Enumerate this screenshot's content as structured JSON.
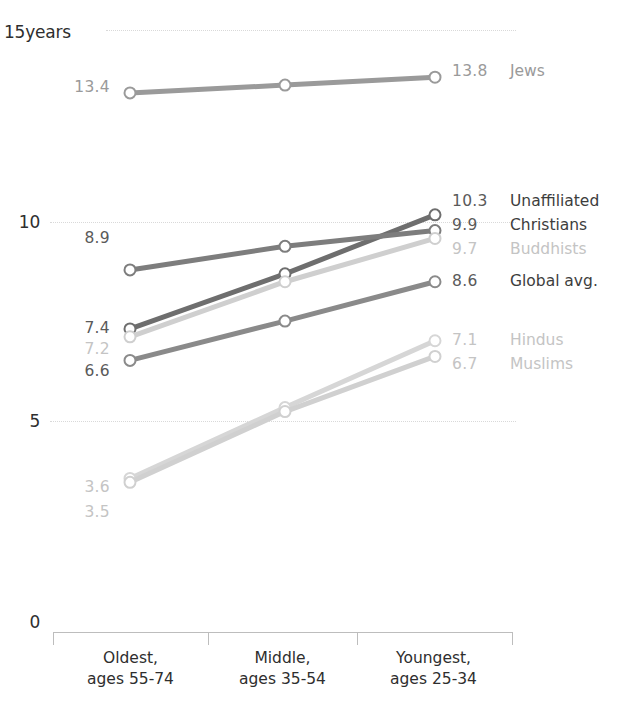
{
  "chart_data": {
    "type": "line",
    "title": "",
    "subtitle": "",
    "xlabel": "",
    "ylabel": "years",
    "ylim": [
      0,
      15
    ],
    "grid": true,
    "legend_position": "right-inline",
    "categories": [
      "Oldest,\nages 55-74",
      "Middle,\nages 35-54",
      "Youngest,\nages 25-34"
    ],
    "x_tick_labels": [
      {
        "line1": "Oldest,",
        "line2": "ages 55-74"
      },
      {
        "line1": "Middle,",
        "line2": "ages 35-54"
      },
      {
        "line1": "Youngest,",
        "line2": "ages 25-34"
      }
    ],
    "y_tick_labels": [
      "15years",
      "10",
      "5",
      "0"
    ],
    "y_ticks": [
      15,
      10,
      5,
      0
    ],
    "series": [
      {
        "name": "Jews",
        "color": "#9a9a9a",
        "values": [
          13.4,
          13.6,
          13.8
        ],
        "start_label": "13.4",
        "end_label": "13.8",
        "label_color": "#9a9a9a",
        "name_color": "#9a9a9a"
      },
      {
        "name": "Unaffiliated",
        "color": "#6e6e6e",
        "values": [
          7.4,
          8.8,
          10.3
        ],
        "start_label": "7.4",
        "end_label": "10.3",
        "label_color": "#5a5a5a",
        "name_color": "#3d3d3d"
      },
      {
        "name": "Christians",
        "color": "#7d7d7d",
        "values": [
          8.9,
          9.5,
          9.9
        ],
        "start_label": "8.9",
        "end_label": "9.9",
        "label_color": "#5a5a5a",
        "name_color": "#3d3d3d"
      },
      {
        "name": "Buddhists",
        "color": "#cfcfcf",
        "values": [
          7.2,
          8.6,
          9.7
        ],
        "start_label": "7.2",
        "end_label": "9.7",
        "label_color": "#c4c4c4",
        "name_color": "#c4c4c4"
      },
      {
        "name": "Global avg.",
        "color": "#8a8a8a",
        "values": [
          6.6,
          7.6,
          8.6
        ],
        "start_label": "6.6",
        "end_label": "8.6",
        "label_color": "#5a5a5a",
        "name_color": "#3d3d3d"
      },
      {
        "name": "Hindus",
        "color": "#d6d6d6",
        "values": [
          3.6,
          5.4,
          7.1
        ],
        "start_label": "3.6",
        "end_label": "7.1",
        "label_color": "#c4c4c4",
        "name_color": "#c4c4c4"
      },
      {
        "name": "Muslims",
        "color": "#d0d0d0",
        "values": [
          3.5,
          5.3,
          6.7
        ],
        "start_label": "3.5",
        "end_label": "6.7",
        "label_color": "#c4c4c4",
        "name_color": "#c4c4c4"
      }
    ],
    "colors": {
      "gridline": "#d9d9d9",
      "axis": "#bdbdbd",
      "marker_fill": "#ffffff",
      "text": "#2e2e2e",
      "muted_text": "#c4c4c4"
    }
  }
}
